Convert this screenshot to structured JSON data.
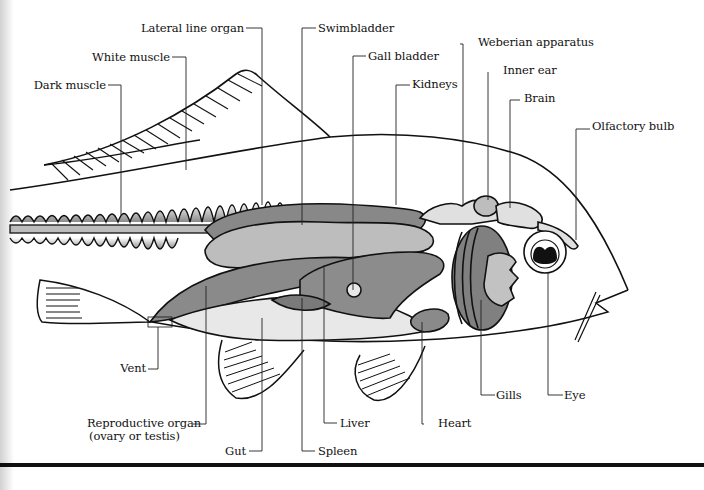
{
  "figure": {
    "colors": {
      "outline": "#111111",
      "dark_organ": "#7a7a7a",
      "mid_organ": "#9a9a9a",
      "light_organ": "#c4c4c4",
      "pale_organ": "#e6e6e6",
      "background": "#ffffff"
    }
  },
  "labels": {
    "lateral_line_organ": "Lateral line organ",
    "swimbladder": "Swimbladder",
    "white_muscle": "White muscle",
    "gall_bladder": "Gall bladder",
    "weberian_apparatus": "Weberian apparatus",
    "inner_ear": "Inner ear",
    "kidneys": "Kidneys",
    "brain": "Brain",
    "dark_muscle": "Dark muscle",
    "olfactory_bulb": "Olfactory bulb",
    "vent": "Vent",
    "reproductive_organ": "Reproductive organ",
    "reproductive_organ_note": "(ovary or testis)",
    "gut": "Gut",
    "spleen": "Spleen",
    "liver": "Liver",
    "heart": "Heart",
    "gills": "Gills",
    "eye": "Eye"
  }
}
